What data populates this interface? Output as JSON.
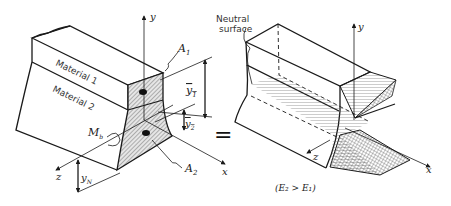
{
  "figure": {
    "left": {
      "labels": {
        "material1": "Material 1",
        "material2": "Material 2",
        "y_axis": "y",
        "x_axis": "x",
        "z_axis": "z",
        "A1": "A",
        "A1_sub": "1",
        "A2": "A",
        "A2_sub": "2",
        "y1bar": "y",
        "y1bar_sub": "1",
        "y2bar": "y",
        "y2bar_sub": "2",
        "yN": "y",
        "yN_sub": "N",
        "Mb": "M",
        "Mb_sub": "b"
      }
    },
    "equals": "=",
    "right": {
      "labels": {
        "neutral_surface_line1": "Neutral",
        "neutral_surface_line2": "surface",
        "y_axis": "y",
        "x_axis": "x",
        "z_axis": "z",
        "condition": "(E₂ > E₁)"
      }
    },
    "colors": {
      "line": "#1a1a1a",
      "hatch_fill": "#d8d8d8",
      "background": "#ffffff"
    }
  }
}
